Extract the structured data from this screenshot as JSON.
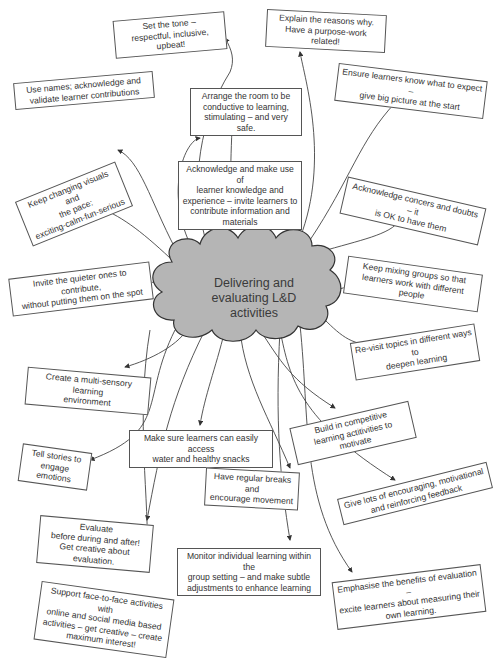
{
  "figure": {
    "central_topic": {
      "line1": "Delivering and",
      "line2": "evaluating L&D",
      "line3": "activities",
      "fill_color": "#b5b5b5",
      "stroke_color": "#333333"
    },
    "nodes": [
      {
        "id": "set-tone",
        "lines": [
          "Set the tone –",
          "respectful, inclusive, upbeat!"
        ]
      },
      {
        "id": "explain-reasons",
        "lines": [
          "Explain the reasons why.",
          "Have a purpose-work related!"
        ]
      },
      {
        "id": "use-names",
        "lines": [
          "Use names; acknowledge and",
          "validate learner contributions"
        ]
      },
      {
        "id": "arrange-room",
        "lines": [
          "Arrange the room to be",
          "conductive to learning,",
          "stimulating – and very safe."
        ]
      },
      {
        "id": "ensure-expect",
        "lines": [
          "Ensure learners know what to expect –",
          "give big picture at the start"
        ]
      },
      {
        "id": "acknowledge-knowledge",
        "lines": [
          "Acknowledge and make use of",
          "learner knowledge and",
          "experience – invite learners to",
          "contribute information and",
          "materials"
        ]
      },
      {
        "id": "changing-visuals",
        "lines": [
          "Keep changing visuals and",
          "the pace:",
          "exciting-calm-fun-serious"
        ]
      },
      {
        "id": "acknowledge-concerns",
        "lines": [
          "Acknowledge concers and doubts – it",
          "is OK to have them"
        ]
      },
      {
        "id": "quieter-ones",
        "lines": [
          "Invite the quieter ones to contribute,",
          "without putting them on the spot"
        ]
      },
      {
        "id": "mixing-groups",
        "lines": [
          "Keep mixing groups so that",
          "learners work with different people"
        ]
      },
      {
        "id": "revisit-topics",
        "lines": [
          "Re-visit topics in different ways to",
          "deepen learning"
        ]
      },
      {
        "id": "multi-sensory",
        "lines": [
          "Create a multi-sensory learning",
          "environment"
        ]
      },
      {
        "id": "competitive",
        "lines": [
          "Build in competitive",
          "learning actitivities to motivate"
        ]
      },
      {
        "id": "water-snacks",
        "lines": [
          "Make sure learners can easily access",
          "water and healthy snacks"
        ]
      },
      {
        "id": "tell-stories",
        "lines": [
          "Tell stories to",
          "engage emotions"
        ]
      },
      {
        "id": "regular-breaks",
        "lines": [
          "Have regular breaks and",
          "encourage movement"
        ]
      },
      {
        "id": "encouraging-feedback",
        "lines": [
          "Give lots of encouraging, motivational",
          "and reinforcing feedback"
        ]
      },
      {
        "id": "evaluate",
        "lines": [
          "Evaluate",
          "before during and after!",
          "Get creative about evaluation."
        ]
      },
      {
        "id": "monitor",
        "lines": [
          "Monitor individual learning within the",
          "group setting – and make subtle",
          "adjustments to enhance learning"
        ]
      },
      {
        "id": "support-online",
        "lines": [
          "Support face-to-face activities with",
          "online and social media based",
          "activities – get creative – create",
          "maximum interest!"
        ]
      },
      {
        "id": "emphasise-evaluation",
        "lines": [
          "Emphasise the benefits of evaluation –",
          "excite learners about measuring their",
          "own learning."
        ]
      }
    ]
  }
}
